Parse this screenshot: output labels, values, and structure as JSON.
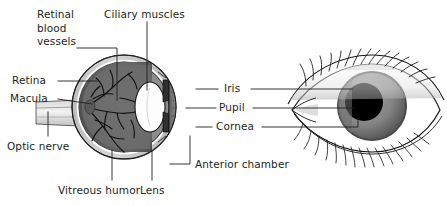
{
  "figure": {
    "background_color": "#ffffff",
    "text_color": "#231f20",
    "labels": {
      "retinal_blood_vessels": "Retinal\nblood\nvessels",
      "ciliary_muscles": "Ciliary muscles",
      "retina": "Retina",
      "macula": "Macula",
      "optic_nerve": "Optic nerve",
      "vitreous_humor": "Vitreous humor",
      "lens": "Lens",
      "anterior_chamber": "Anterior chamber",
      "iris": "Iris",
      "pupil": "Pupil",
      "cornea": "Cornea"
    },
    "colors": {
      "sclera": "#c9c9c9",
      "sclera_inner": "#ffffff",
      "choroid": "#8a8a8a",
      "retina_interior": "#6e6e6e",
      "vitreous": "#5a5a5a",
      "lens_fill": "#fdfdfd",
      "iris_dark": "#3a3a3a",
      "cornea_fill": "#b9b9b9",
      "vessel_stroke": "#111111",
      "outline": "#1a1a1a",
      "eye_iris": "#8b8b8b",
      "eye_iris_dark": "#5e5e5e",
      "eye_pupil": "#000000",
      "eyelid_shadow": "#9a9a9a",
      "leader_line": "#231f20"
    },
    "views": {
      "cross_section": "sagittal-eye-cross-section",
      "external": "external-eye-front-view"
    }
  }
}
